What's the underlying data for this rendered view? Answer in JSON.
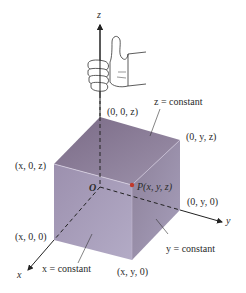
{
  "axes": {
    "x": "x",
    "y": "y",
    "z": "z",
    "origin": "O"
  },
  "point": {
    "label": "P(x, y, z)",
    "color": "#c0392b"
  },
  "vertices": {
    "z_axis": "(0, 0, z)",
    "yz": "(0, y, z)",
    "xz": "(x, 0, z)",
    "y_axis": "(0, y, 0)",
    "x_axis": "(x, 0, 0)",
    "xy": "(x, y, 0)"
  },
  "planes": {
    "z_const": "z = constant",
    "x_const": "x = constant",
    "y_const": "y = constant"
  },
  "colors": {
    "top_face": "#8e7f99",
    "front_face": "#a49bb8",
    "right_face": "#9a90ad",
    "line": "#222222"
  }
}
